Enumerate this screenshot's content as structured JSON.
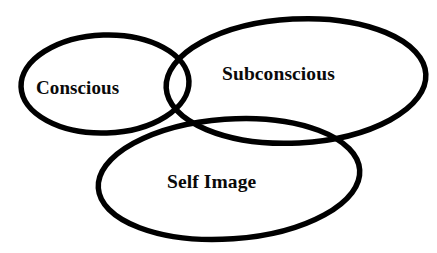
{
  "diagram": {
    "type": "venn",
    "title": "",
    "background_color": "#ffffff",
    "stroke_color": "#000000",
    "text_color": "#0a0a0a",
    "sets": [
      {
        "id": "conscious",
        "label": "Conscious",
        "shape": "ellipse",
        "cx": 105,
        "cy": 84,
        "rx": 84,
        "ry": 49,
        "rotation": -2
      },
      {
        "id": "subconscious",
        "label": "Subconscious",
        "shape": "ellipse",
        "cx": 296,
        "cy": 81,
        "rx": 130,
        "ry": 62,
        "rotation": -3
      },
      {
        "id": "self-image",
        "label": "Self Image",
        "shape": "ellipse",
        "cx": 229,
        "cy": 179,
        "rx": 131,
        "ry": 60,
        "rotation": -4
      }
    ]
  }
}
